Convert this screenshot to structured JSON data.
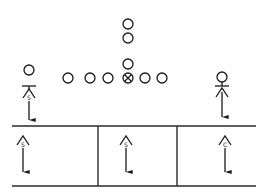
{
  "diagram": {
    "title": "",
    "offense": {
      "line": [
        {
          "role": "lineman",
          "x": 68,
          "y": 78,
          "symbol": "circle"
        },
        {
          "role": "lineman",
          "x": 90,
          "y": 78,
          "symbol": "circle"
        },
        {
          "role": "lineman",
          "x": 108,
          "y": 78,
          "symbol": "circle"
        },
        {
          "role": "center",
          "x": 128,
          "y": 78,
          "symbol": "circle-x"
        },
        {
          "role": "lineman",
          "x": 145,
          "y": 78,
          "symbol": "circle"
        },
        {
          "role": "lineman",
          "x": 162,
          "y": 78,
          "symbol": "circle"
        }
      ],
      "backs": [
        {
          "role": "quarterback",
          "x": 128,
          "y": 64
        },
        {
          "role": "back",
          "x": 128,
          "y": 38
        },
        {
          "role": "back",
          "x": 128,
          "y": 24
        }
      ],
      "receivers": [
        {
          "side": "left",
          "x": 29,
          "y": 70,
          "block": "T"
        },
        {
          "side": "right",
          "x": 222,
          "y": 77
        }
      ]
    },
    "defenders": [
      {
        "label": "S",
        "x": 29,
        "y": 99,
        "zone": "line",
        "arrow_to": 120
      },
      {
        "label": "S",
        "x": 23,
        "y": 139,
        "zone": "deep-left",
        "arrow_to": 172
      },
      {
        "label": "S",
        "x": 126,
        "y": 139,
        "zone": "deep-middle",
        "arrow_to": 172
      },
      {
        "label": "C",
        "x": 225,
        "y": 139,
        "zone": "deep-right",
        "arrow_to": 172
      },
      {
        "label": "",
        "x": 222,
        "y": 97,
        "zone": "right-flat",
        "arrow_to": 117
      }
    ],
    "zones": {
      "top_y": 126,
      "bottom_y": 186,
      "left_x": 12,
      "right_x": 256,
      "dividers_x": [
        98,
        177
      ]
    }
  }
}
